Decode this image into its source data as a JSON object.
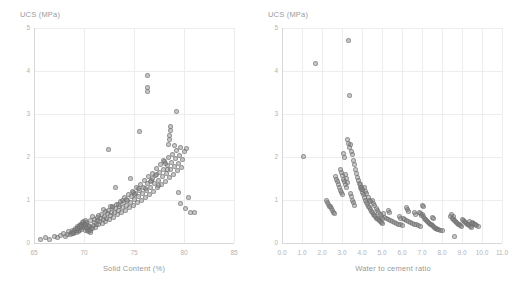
{
  "figure": {
    "background": "#ffffff",
    "marker_color": "#828282",
    "grid_color": "#ededed",
    "axis_color": "#d8d8d8",
    "tick_text_color": "#b3b3b3",
    "label_text_color": "#9a9a9a"
  },
  "panels": {
    "left": {
      "ylabel": "UCS (MPa)",
      "xlabel": "Solid Content (%)",
      "yticks": [
        "5",
        "4",
        "3",
        "2",
        "1",
        "0"
      ],
      "xticks": [
        "65",
        "70",
        "75",
        "80",
        "85"
      ]
    },
    "right": {
      "ylabel": "UCS (MPa)",
      "xlabel": "Water to cement ratio",
      "yticks": [
        "5",
        "4",
        "3",
        "2",
        "1",
        "0"
      ],
      "xticks": [
        "0.0",
        "1.0",
        "2.0",
        "3.0",
        "4.0",
        "5.0",
        "6.0",
        "7.0",
        "8.0",
        "9.0",
        "10.0",
        "11.0"
      ]
    }
  },
  "chart_data": [
    {
      "type": "scatter",
      "panel": "left",
      "title": "",
      "xlabel": "Solid Content (%)",
      "ylabel": "UCS (MPa)",
      "xlim": [
        65,
        85
      ],
      "ylim": [
        0,
        5
      ],
      "xticks": [
        65,
        70,
        75,
        80,
        85
      ],
      "yticks": [
        0,
        1,
        2,
        3,
        4,
        5
      ],
      "grid": true,
      "legend": null,
      "series": [
        {
          "name": "Samples",
          "x": [
            65.6,
            66.1,
            66.5,
            67.0,
            67.3,
            67.6,
            67.9,
            68.1,
            68.3,
            68.4,
            68.6,
            68.7,
            68.8,
            68.9,
            69.0,
            69.1,
            69.2,
            69.3,
            69.35,
            69.4,
            69.45,
            69.5,
            69.55,
            69.6,
            69.65,
            69.7,
            69.75,
            69.8,
            69.85,
            69.9,
            69.95,
            70.0,
            70.05,
            70.1,
            70.15,
            70.2,
            70.25,
            70.3,
            70.35,
            70.4,
            70.45,
            70.5,
            70.55,
            70.6,
            70.65,
            70.7,
            70.8,
            70.9,
            71.0,
            71.1,
            71.2,
            71.3,
            71.35,
            71.4,
            71.5,
            71.6,
            71.7,
            71.8,
            71.9,
            72.0,
            72.1,
            72.2,
            72.3,
            72.4,
            72.5,
            72.6,
            72.7,
            72.8,
            72.9,
            73.0,
            73.1,
            73.2,
            73.3,
            73.4,
            73.5,
            73.6,
            73.7,
            73.8,
            73.9,
            74.0,
            74.1,
            74.2,
            74.3,
            74.4,
            74.5,
            74.6,
            74.7,
            74.8,
            74.9,
            75.0,
            75.1,
            75.2,
            75.3,
            75.4,
            75.5,
            75.6,
            75.7,
            75.8,
            75.9,
            76.0,
            76.1,
            76.2,
            76.3,
            76.4,
            76.5,
            76.6,
            76.7,
            76.8,
            76.9,
            77.0,
            77.1,
            77.2,
            77.3,
            77.4,
            77.5,
            77.6,
            77.7,
            77.8,
            77.9,
            78.0,
            78.1,
            78.2,
            78.3,
            78.4,
            78.5,
            78.6,
            78.7,
            78.8,
            78.9,
            79.0,
            79.1,
            79.2,
            79.3,
            79.4,
            79.5,
            79.6,
            79.7,
            79.8,
            80.0,
            80.2,
            80.4,
            80.6,
            81.0,
            72.4,
            76.3,
            76.3,
            76.3,
            78.5,
            78.5,
            78.6,
            78.6,
            78.4,
            79.2,
            79.0,
            75.5,
            73.1,
            74.6,
            71.0,
            68.9,
            69.2,
            77.9,
            78.1,
            78.3,
            77.2,
            76.6,
            76.8,
            74.9,
            75.4,
            73.8,
            72.6,
            71.9,
            70.8,
            70.2,
            69.7,
            79.4,
            79.6,
            80.1,
            77.4,
            76.1,
            75.0,
            74.2,
            73.4,
            72.8,
            72.1,
            71.4,
            70.6,
            70.1,
            69.6,
            69.3,
            68.8
          ],
          "y": [
            0.09,
            0.12,
            0.08,
            0.16,
            0.13,
            0.18,
            0.22,
            0.15,
            0.2,
            0.26,
            0.19,
            0.24,
            0.3,
            0.22,
            0.28,
            0.34,
            0.25,
            0.31,
            0.38,
            0.27,
            0.33,
            0.41,
            0.29,
            0.36,
            0.44,
            0.32,
            0.39,
            0.47,
            0.35,
            0.42,
            0.5,
            0.38,
            0.45,
            0.53,
            0.3,
            0.36,
            0.43,
            0.28,
            0.34,
            0.4,
            0.26,
            0.32,
            0.38,
            0.24,
            0.3,
            0.36,
            0.33,
            0.4,
            0.47,
            0.36,
            0.44,
            0.52,
            0.6,
            0.42,
            0.5,
            0.58,
            0.66,
            0.46,
            0.54,
            0.62,
            0.5,
            0.58,
            0.68,
            0.76,
            0.54,
            0.63,
            0.72,
            0.82,
            0.6,
            0.7,
            0.8,
            0.9,
            0.66,
            0.76,
            0.86,
            0.96,
            0.7,
            0.82,
            0.94,
            1.06,
            0.76,
            0.88,
            1.0,
            1.12,
            0.82,
            0.95,
            1.08,
            1.2,
            0.88,
            1.02,
            1.15,
            1.28,
            0.94,
            1.08,
            1.22,
            1.36,
            1.0,
            1.15,
            1.3,
            1.45,
            1.06,
            1.22,
            1.38,
            1.54,
            1.12,
            1.3,
            1.46,
            1.62,
            1.2,
            1.38,
            1.56,
            1.74,
            1.28,
            1.46,
            1.64,
            1.82,
            1.36,
            1.54,
            1.72,
            1.9,
            1.44,
            1.62,
            1.8,
            1.98,
            1.52,
            1.7,
            1.88,
            2.06,
            1.6,
            1.78,
            1.96,
            2.14,
            1.68,
            1.86,
            2.04,
            2.22,
            1.76,
            1.94,
            2.12,
            2.2,
            1.05,
            0.7,
            0.72,
            2.18,
            3.9,
            3.62,
            3.52,
            2.4,
            2.5,
            2.62,
            2.7,
            2.28,
            3.05,
            2.26,
            2.6,
            1.28,
            1.5,
            0.55,
            0.25,
            0.29,
            1.92,
            1.85,
            1.7,
            1.6,
            1.42,
            1.5,
            1.18,
            1.26,
            0.98,
            0.86,
            0.78,
            0.62,
            0.48,
            0.4,
            1.18,
            0.92,
            0.8,
            1.34,
            1.26,
            1.12,
            1.02,
            0.9,
            0.84,
            0.74,
            0.64,
            0.52,
            0.44,
            0.38,
            0.34,
            0.22
          ]
        }
      ]
    },
    {
      "type": "scatter",
      "panel": "right",
      "title": "",
      "xlabel": "Water to cement ratio",
      "ylabel": "UCS (MPa)",
      "xlim": [
        0,
        11
      ],
      "ylim": [
        0,
        5
      ],
      "xticks": [
        0,
        1,
        2,
        3,
        4,
        5,
        6,
        7,
        8,
        9,
        10,
        11
      ],
      "yticks": [
        0,
        1,
        2,
        3,
        4,
        5
      ],
      "grid": true,
      "legend": null,
      "series": [
        {
          "name": "Samples",
          "x": [
            1.05,
            1.65,
            3.3,
            3.35,
            3.4,
            3.05,
            3.1,
            3.45,
            3.5,
            3.55,
            2.65,
            2.7,
            2.75,
            2.8,
            2.85,
            2.9,
            2.95,
            3.0,
            3.15,
            3.2,
            3.25,
            3.6,
            3.65,
            3.7,
            3.75,
            3.8,
            3.85,
            3.9,
            3.95,
            4.0,
            2.4,
            2.45,
            2.5,
            2.55,
            2.6,
            4.05,
            4.1,
            4.15,
            4.2,
            4.25,
            4.3,
            4.35,
            4.4,
            4.45,
            4.5,
            4.55,
            4.6,
            4.65,
            4.7,
            4.75,
            4.8,
            4.85,
            4.9,
            4.95,
            5.0,
            5.1,
            5.2,
            5.3,
            5.4,
            5.5,
            5.6,
            5.7,
            5.8,
            5.9,
            6.0,
            6.1,
            6.2,
            6.3,
            6.4,
            6.5,
            6.6,
            6.7,
            6.8,
            6.9,
            7.0,
            7.05,
            7.1,
            7.15,
            7.2,
            7.25,
            7.3,
            7.35,
            7.4,
            7.45,
            7.5,
            7.55,
            7.6,
            7.65,
            7.7,
            7.75,
            7.8,
            7.9,
            8.0,
            8.4,
            8.5,
            8.55,
            8.6,
            8.65,
            8.7,
            8.75,
            8.8,
            8.85,
            8.9,
            8.95,
            9.0,
            9.05,
            9.1,
            9.15,
            9.2,
            9.25,
            9.3,
            9.35,
            9.4,
            9.45,
            9.5,
            9.55,
            9.6,
            9.7,
            9.8,
            8.6,
            2.2,
            2.25,
            2.3,
            2.35,
            3.25,
            3.3,
            3.35,
            3.4,
            3.45,
            3.5,
            3.55,
            3.6,
            4.1,
            4.15,
            4.2,
            4.5,
            4.55,
            4.6,
            5.3,
            5.35,
            6.2,
            6.25,
            6.3,
            6.6,
            6.65,
            7.0,
            7.05,
            5.85,
            5.9,
            6.05,
            3.9,
            3.95,
            4.0,
            4.3,
            4.35,
            4.4,
            4.7,
            4.75,
            4.8,
            5.05,
            2.9,
            2.95,
            3.0,
            3.05,
            3.1,
            3.15,
            3.2,
            4.9,
            4.95,
            5.0,
            6.85,
            6.9,
            6.95,
            7.5,
            7.55,
            8.45,
            8.55,
            9.35,
            9.45,
            9.65
          ],
          "y": [
            2.02,
            4.18,
            4.72,
            3.42,
            2.3,
            2.08,
            1.98,
            2.12,
            2.05,
            1.92,
            1.55,
            1.48,
            1.42,
            1.35,
            1.28,
            1.22,
            1.18,
            1.12,
            1.6,
            1.5,
            1.4,
            1.82,
            1.72,
            1.62,
            1.52,
            1.45,
            1.38,
            1.3,
            1.24,
            1.18,
            0.85,
            0.8,
            0.76,
            0.72,
            0.68,
            1.12,
            1.06,
            1.0,
            0.95,
            0.9,
            0.86,
            0.82,
            0.78,
            0.74,
            0.7,
            0.67,
            0.64,
            0.61,
            0.58,
            0.56,
            0.54,
            0.52,
            0.5,
            0.48,
            0.46,
            0.6,
            0.58,
            0.55,
            0.52,
            0.5,
            0.48,
            0.46,
            0.44,
            0.42,
            0.4,
            0.54,
            0.52,
            0.5,
            0.48,
            0.46,
            0.44,
            0.42,
            0.4,
            0.38,
            0.66,
            0.62,
            0.58,
            0.55,
            0.52,
            0.5,
            0.48,
            0.46,
            0.44,
            0.42,
            0.4,
            0.38,
            0.36,
            0.34,
            0.33,
            0.32,
            0.31,
            0.3,
            0.29,
            0.62,
            0.58,
            0.55,
            0.52,
            0.5,
            0.48,
            0.46,
            0.44,
            0.42,
            0.4,
            0.38,
            0.55,
            0.52,
            0.5,
            0.48,
            0.46,
            0.44,
            0.42,
            0.4,
            0.38,
            0.36,
            0.48,
            0.46,
            0.44,
            0.4,
            0.38,
            0.14,
            1.0,
            0.95,
            0.9,
            0.86,
            2.4,
            2.32,
            2.22,
            1.15,
            1.08,
            1.0,
            0.94,
            0.88,
            1.28,
            1.2,
            1.14,
            0.98,
            0.92,
            0.88,
            0.76,
            0.72,
            0.82,
            0.78,
            0.74,
            0.7,
            0.66,
            0.88,
            0.84,
            0.62,
            0.58,
            0.56,
            1.36,
            1.3,
            1.24,
            1.05,
            1.0,
            0.96,
            0.8,
            0.76,
            0.72,
            0.68,
            1.7,
            1.64,
            1.56,
            1.48,
            1.42,
            1.36,
            1.3,
            0.66,
            0.62,
            0.58,
            0.72,
            0.68,
            0.64,
            0.6,
            0.56,
            0.66,
            0.62,
            0.5,
            0.46,
            0.42
          ]
        }
      ]
    }
  ]
}
